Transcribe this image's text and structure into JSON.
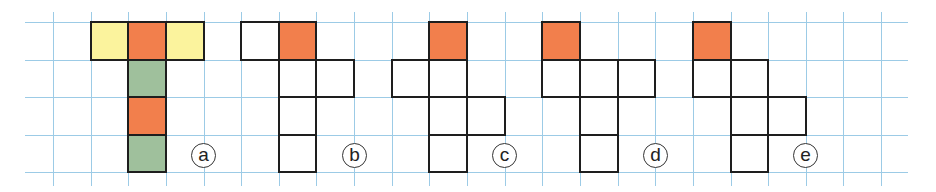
{
  "diagram": {
    "type": "grid-nets",
    "grid": {
      "line_color": "#9ccbe6",
      "origin_x": 53,
      "step_x": 37.64,
      "cols": 23,
      "origin_y": 22,
      "step_y": 37.5,
      "rows": 5,
      "x_extent": [
        25,
        908
      ],
      "y_extent": [
        12,
        186
      ]
    },
    "colors": {
      "yellow": "#fbf39d",
      "orange": "#f27f4c",
      "green": "#9fc09c",
      "white": "#ffffff",
      "border": "#1e1e1e"
    },
    "figures": [
      {
        "label": "a",
        "label_col": 4,
        "cells": [
          {
            "col": 1,
            "row": 0,
            "fill": "yellow"
          },
          {
            "col": 2,
            "row": 0,
            "fill": "orange"
          },
          {
            "col": 3,
            "row": 0,
            "fill": "yellow"
          },
          {
            "col": 2,
            "row": 1,
            "fill": "green"
          },
          {
            "col": 2,
            "row": 2,
            "fill": "orange"
          },
          {
            "col": 2,
            "row": 3,
            "fill": "green"
          }
        ]
      },
      {
        "label": "b",
        "label_col": 8,
        "cells": [
          {
            "col": 5,
            "row": 0,
            "fill": "white"
          },
          {
            "col": 6,
            "row": 0,
            "fill": "orange"
          },
          {
            "col": 6,
            "row": 1,
            "fill": "white"
          },
          {
            "col": 7,
            "row": 1,
            "fill": "white"
          },
          {
            "col": 6,
            "row": 2,
            "fill": "white"
          },
          {
            "col": 6,
            "row": 3,
            "fill": "white"
          }
        ]
      },
      {
        "label": "c",
        "label_col": 12,
        "cells": [
          {
            "col": 10,
            "row": 0,
            "fill": "orange"
          },
          {
            "col": 9,
            "row": 1,
            "fill": "white"
          },
          {
            "col": 10,
            "row": 1,
            "fill": "white"
          },
          {
            "col": 10,
            "row": 2,
            "fill": "white"
          },
          {
            "col": 11,
            "row": 2,
            "fill": "white"
          },
          {
            "col": 10,
            "row": 3,
            "fill": "white"
          }
        ]
      },
      {
        "label": "d",
        "label_col": 16,
        "cells": [
          {
            "col": 13,
            "row": 0,
            "fill": "orange"
          },
          {
            "col": 13,
            "row": 1,
            "fill": "white"
          },
          {
            "col": 14,
            "row": 1,
            "fill": "white"
          },
          {
            "col": 15,
            "row": 1,
            "fill": "white"
          },
          {
            "col": 14,
            "row": 2,
            "fill": "white"
          },
          {
            "col": 14,
            "row": 3,
            "fill": "white"
          }
        ]
      },
      {
        "label": "e",
        "label_col": 20,
        "cells": [
          {
            "col": 17,
            "row": 0,
            "fill": "orange"
          },
          {
            "col": 17,
            "row": 1,
            "fill": "white"
          },
          {
            "col": 18,
            "row": 1,
            "fill": "white"
          },
          {
            "col": 18,
            "row": 2,
            "fill": "white"
          },
          {
            "col": 19,
            "row": 2,
            "fill": "white"
          },
          {
            "col": 18,
            "row": 3,
            "fill": "white"
          }
        ]
      }
    ]
  }
}
